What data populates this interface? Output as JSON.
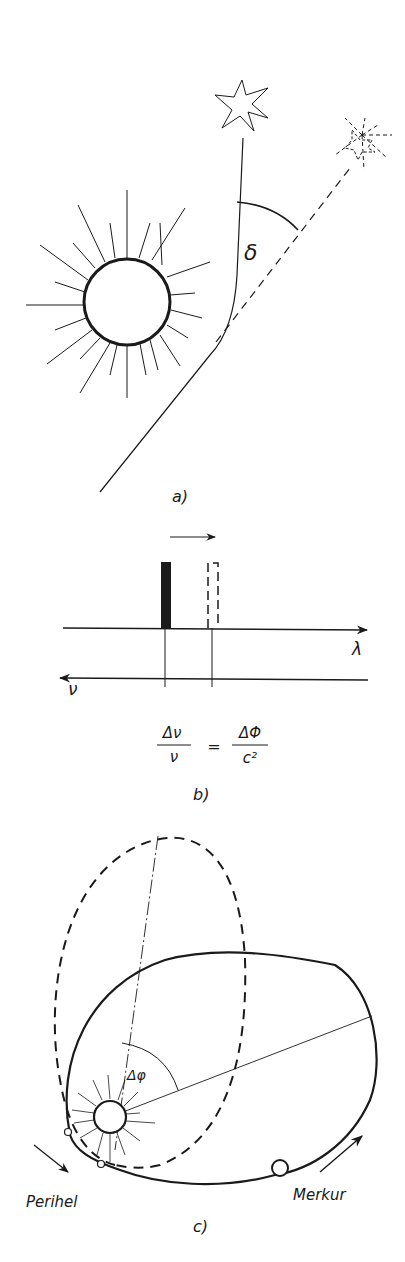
{
  "figure": {
    "panels": [
      {
        "id": "a",
        "label": "a)",
        "description": "Light deflection of a star's light passing near the Sun",
        "angle_symbol": "δ",
        "elements": [
          "sun",
          "true-star",
          "apparent-star",
          "light-path",
          "apparent-direction-dashed",
          "deflection-angle-arc"
        ]
      },
      {
        "id": "b",
        "label": "b)",
        "description": "Gravitational redshift of a spectral line",
        "axis_lambda": "λ",
        "axis_nu": "ν",
        "formula": {
          "lhs_num": "Δν",
          "lhs_den": "ν",
          "equals": "=",
          "rhs_num": "ΔΦ",
          "rhs_den": "c²"
        }
      },
      {
        "id": "c",
        "label": "c)",
        "description": "Perihelion precession of Mercury",
        "angle_symbol": "Δφ",
        "perihelion_label": "Perihel",
        "planet_label": "Merkur"
      }
    ]
  },
  "colors": {
    "ink": "#1a1a1a",
    "background": "#ffffff"
  }
}
